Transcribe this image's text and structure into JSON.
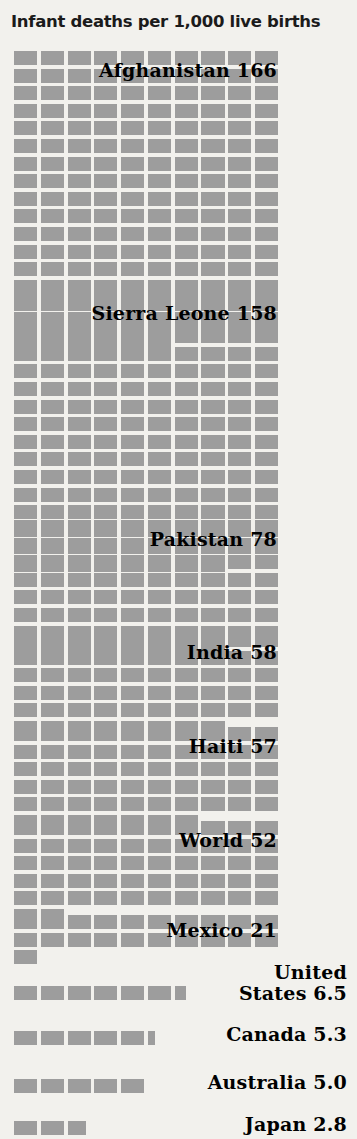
{
  "chart_data": {
    "type": "bar",
    "subtype": "pictogram-unit-grid",
    "title": "Infant deaths per 1,000 live births",
    "xlabel": "",
    "ylabel": "Infant deaths per 1,000 live births",
    "unit": "1 square = 1 infant death per 1,000 live births",
    "columns_per_row": 10,
    "categories": [
      "Afghanistan",
      "Sierra Leone",
      "Pakistan",
      "India",
      "Haiti",
      "World",
      "Mexico",
      "United States",
      "Canada",
      "Australia",
      "Japan"
    ],
    "values": [
      166,
      158,
      78,
      58,
      57,
      52,
      21,
      6.5,
      5.3,
      5.0,
      2.8
    ],
    "series": [
      {
        "name": "Infant mortality rate",
        "values": [
          166,
          158,
          78,
          58,
          57,
          52,
          21,
          6.5,
          5.3,
          5.0,
          2.8
        ]
      }
    ],
    "colors": {
      "cell": "#9d9d9d",
      "background": "#f2f1ed",
      "label_text": "#000000",
      "title_text": "#1b1b1b"
    },
    "grid": false,
    "legend": "none"
  },
  "header": {
    "title": "Infant deaths per 1,000 live births"
  },
  "blocks": [
    {
      "country": "Afghanistan",
      "value": "166",
      "label": "Afghanistan 166",
      "full_rows": 16,
      "remainder": 6,
      "remainder_type": "full",
      "top": 51,
      "label_top": 61,
      "label_right": 277,
      "two_line": false
    },
    {
      "country": "Sierra Leone",
      "value": "158",
      "label": "Sierra Leone 158",
      "full_rows": 15,
      "remainder": 8,
      "remainder_type": "full",
      "top": 294,
      "label_top": 304,
      "label_right": 277,
      "two_line": false
    },
    {
      "country": "Pakistan",
      "value": "78",
      "label": "Pakistan 78",
      "full_rows": 7,
      "remainder": 8,
      "remainder_type": "full",
      "top": 520,
      "label_top": 530,
      "label_right": 277,
      "two_line": false
    },
    {
      "country": "India",
      "value": "58",
      "label": "India 58",
      "full_rows": 5,
      "remainder": 8,
      "remainder_type": "full",
      "top": 633,
      "label_top": 643,
      "label_right": 277,
      "two_line": false
    },
    {
      "country": "Haiti",
      "value": "57",
      "label": "Haiti 57",
      "full_rows": 5,
      "remainder": 7,
      "remainder_type": "full",
      "top": 727,
      "label_top": 737,
      "label_right": 277,
      "two_line": false
    },
    {
      "country": "World",
      "value": "52",
      "label": "World 52",
      "full_rows": 5,
      "remainder": 2,
      "remainder_type": "full",
      "top": 821,
      "label_top": 831,
      "label_right": 277,
      "two_line": false
    },
    {
      "country": "Mexico",
      "value": "21",
      "label": "Mexico 21",
      "full_rows": 2,
      "remainder": 1,
      "remainder_type": "full",
      "top": 915,
      "label_top": 921,
      "label_right": 277,
      "two_line": false
    },
    {
      "country": "United States",
      "value": "6.5",
      "label": "United\nStates 6.5",
      "label_line1": "United",
      "label_line2": "States 6.5",
      "full_rows": 0,
      "remainder": 6,
      "remainder_type": "half",
      "top": 986,
      "label_top": 962,
      "label_right": 347,
      "two_line": true
    },
    {
      "country": "Canada",
      "value": "5.3",
      "label": "Canada 5.3",
      "full_rows": 0,
      "remainder": 5,
      "remainder_type": "small",
      "top": 1031,
      "label_top": 1025,
      "label_right": 347,
      "two_line": false
    },
    {
      "country": "Australia",
      "value": "5.0",
      "label": "Australia 5.0",
      "full_rows": 0,
      "remainder": 5,
      "remainder_type": "none",
      "top": 1079,
      "label_top": 1073,
      "label_right": 347,
      "two_line": false
    },
    {
      "country": "Japan",
      "value": "2.8",
      "label": "Japan 2.8",
      "full_rows": 0,
      "remainder": 2,
      "remainder_type": "large",
      "top": 1121,
      "label_top": 1115,
      "label_right": 347,
      "two_line": false
    }
  ]
}
